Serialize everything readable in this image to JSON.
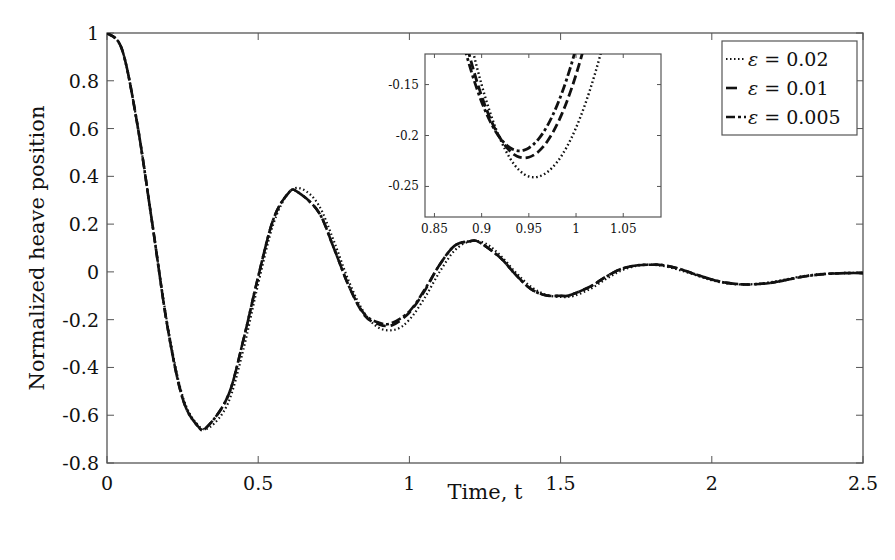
{
  "chart_data": {
    "type": "line",
    "title": "",
    "xlabel": "Time, t",
    "ylabel": "Normalized heave position",
    "xlim": [
      0,
      2.5
    ],
    "ylim": [
      -0.8,
      1
    ],
    "xticks": [
      0,
      0.5,
      1,
      1.5,
      2,
      2.5
    ],
    "xtick_labels": [
      "0",
      "0.5",
      "1",
      "1.5",
      "2",
      "2.5"
    ],
    "yticks": [
      -0.8,
      -0.6,
      -0.4,
      -0.2,
      0,
      0.2,
      0.4,
      0.6,
      0.8,
      1
    ],
    "ytick_labels": [
      "-0.8",
      "-0.6",
      "-0.4",
      "-0.2",
      "0",
      "0.2",
      "0.4",
      "0.6",
      "0.8",
      "1"
    ],
    "grid": false,
    "legend_position": "upper right",
    "series": [
      {
        "name": "ε = 0.02",
        "eps": "0.02",
        "style": "dotted",
        "x": [
          0,
          0.05,
          0.1,
          0.15,
          0.2,
          0.25,
          0.3,
          0.34,
          0.4,
          0.45,
          0.5,
          0.55,
          0.6,
          0.645,
          0.7,
          0.75,
          0.8,
          0.85,
          0.9,
          0.955,
          1.0,
          1.05,
          1.1,
          1.15,
          1.2,
          1.25,
          1.3,
          1.35,
          1.4,
          1.45,
          1.5,
          1.545,
          1.6,
          1.65,
          1.7,
          1.75,
          1.8,
          1.85,
          1.9,
          1.95,
          2.0,
          2.05,
          2.1,
          2.15,
          2.2,
          2.25,
          2.3,
          2.35,
          2.4,
          2.45,
          2.5
        ],
        "y": [
          1.0,
          0.93,
          0.62,
          0.2,
          -0.22,
          -0.52,
          -0.64,
          -0.65,
          -0.55,
          -0.33,
          -0.05,
          0.2,
          0.33,
          0.347,
          0.28,
          0.13,
          -0.04,
          -0.17,
          -0.235,
          -0.241,
          -0.2,
          -0.11,
          0.0,
          0.09,
          0.128,
          0.12,
          0.07,
          0.0,
          -0.06,
          -0.095,
          -0.105,
          -0.1,
          -0.07,
          -0.03,
          0.005,
          0.025,
          0.03,
          0.022,
          0.005,
          -0.015,
          -0.035,
          -0.048,
          -0.053,
          -0.05,
          -0.042,
          -0.03,
          -0.018,
          -0.01,
          -0.006,
          -0.004,
          -0.004
        ]
      },
      {
        "name": "ε = 0.01",
        "eps": "0.01",
        "style": "dashed",
        "x": [
          0,
          0.05,
          0.1,
          0.15,
          0.2,
          0.25,
          0.3,
          0.33,
          0.4,
          0.45,
          0.5,
          0.55,
          0.6,
          0.63,
          0.7,
          0.75,
          0.8,
          0.85,
          0.9,
          0.945,
          1.0,
          1.05,
          1.1,
          1.15,
          1.2,
          1.23,
          1.3,
          1.35,
          1.4,
          1.45,
          1.5,
          1.53,
          1.6,
          1.65,
          1.7,
          1.75,
          1.8,
          1.84,
          1.9,
          1.95,
          2.0,
          2.05,
          2.1,
          2.14,
          2.2,
          2.25,
          2.3,
          2.35,
          2.4,
          2.45,
          2.5
        ],
        "y": [
          1.0,
          0.93,
          0.62,
          0.2,
          -0.23,
          -0.53,
          -0.645,
          -0.65,
          -0.52,
          -0.29,
          -0.02,
          0.22,
          0.33,
          0.335,
          0.25,
          0.1,
          -0.06,
          -0.18,
          -0.22,
          -0.222,
          -0.17,
          -0.08,
          0.03,
          0.11,
          0.128,
          0.125,
          0.06,
          -0.01,
          -0.07,
          -0.098,
          -0.1,
          -0.098,
          -0.06,
          -0.02,
          0.012,
          0.027,
          0.03,
          0.028,
          0.01,
          -0.012,
          -0.032,
          -0.046,
          -0.052,
          -0.052,
          -0.045,
          -0.033,
          -0.02,
          -0.012,
          -0.007,
          -0.005,
          -0.005
        ]
      },
      {
        "name": "ε = 0.005",
        "eps": "0.005",
        "style": "dash-dot",
        "x": [
          0,
          0.05,
          0.1,
          0.15,
          0.2,
          0.25,
          0.3,
          0.33,
          0.4,
          0.45,
          0.5,
          0.55,
          0.6,
          0.63,
          0.7,
          0.75,
          0.8,
          0.85,
          0.9,
          0.94,
          1.0,
          1.05,
          1.1,
          1.15,
          1.2,
          1.23,
          1.3,
          1.35,
          1.4,
          1.45,
          1.5,
          1.53,
          1.6,
          1.65,
          1.7,
          1.75,
          1.8,
          1.84,
          1.9,
          1.95,
          2.0,
          2.05,
          2.1,
          2.14,
          2.2,
          2.25,
          2.3,
          2.35,
          2.4,
          2.45,
          2.5
        ],
        "y": [
          1.0,
          0.93,
          0.62,
          0.2,
          -0.23,
          -0.53,
          -0.645,
          -0.65,
          -0.52,
          -0.29,
          -0.02,
          0.22,
          0.33,
          0.335,
          0.25,
          0.1,
          -0.06,
          -0.175,
          -0.213,
          -0.215,
          -0.165,
          -0.075,
          0.03,
          0.11,
          0.128,
          0.125,
          0.06,
          -0.01,
          -0.07,
          -0.098,
          -0.1,
          -0.098,
          -0.06,
          -0.02,
          0.012,
          0.027,
          0.03,
          0.028,
          0.01,
          -0.012,
          -0.032,
          -0.046,
          -0.052,
          -0.052,
          -0.045,
          -0.033,
          -0.02,
          -0.012,
          -0.007,
          -0.005,
          -0.005
        ]
      }
    ],
    "inset": {
      "xlim": [
        0.84,
        1.09
      ],
      "ylim": [
        -0.28,
        -0.12
      ],
      "xticks": [
        0.85,
        0.9,
        0.95,
        1,
        1.05
      ],
      "xtick_labels": [
        "0.85",
        "0.9",
        "0.95",
        "1",
        "1.05"
      ],
      "yticks": [
        -0.25,
        -0.2,
        -0.15
      ],
      "ytick_labels": [
        "-0.25",
        "-0.2",
        "-0.15"
      ],
      "minima": [
        {
          "series": "ε = 0.02",
          "t": 0.955,
          "value": -0.241
        },
        {
          "series": "ε = 0.01",
          "t": 0.945,
          "value": -0.222
        },
        {
          "series": "ε = 0.005",
          "t": 0.94,
          "value": -0.215
        }
      ]
    }
  },
  "legend": {
    "items": [
      {
        "symbol": "ε",
        "text": " = 0.02"
      },
      {
        "symbol": "ε",
        "text": " = 0.01"
      },
      {
        "symbol": "ε",
        "text": " = 0.005"
      }
    ]
  },
  "colors": {
    "line": "#111111",
    "axis": "#555555",
    "background": "#ffffff"
  }
}
